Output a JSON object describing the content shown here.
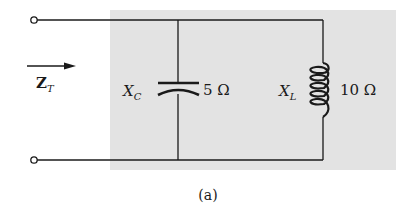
{
  "diagram": {
    "type": "parallel-ac-circuit",
    "caption": "(a)",
    "input": {
      "label_main": "Z",
      "label_sub": "T",
      "arrow_direction": "right"
    },
    "components": [
      {
        "kind": "capacitor",
        "symbol_main": "X",
        "symbol_sub": "C",
        "value": "5 Ω"
      },
      {
        "kind": "inductor",
        "symbol_main": "X",
        "symbol_sub": "L",
        "value": "10 Ω"
      }
    ],
    "terminals": [
      "top-terminal",
      "bottom-terminal"
    ],
    "colors": {
      "wire": "#1a1a1a",
      "shaded_box": "#e3e3e3",
      "background": "#ffffff"
    }
  }
}
